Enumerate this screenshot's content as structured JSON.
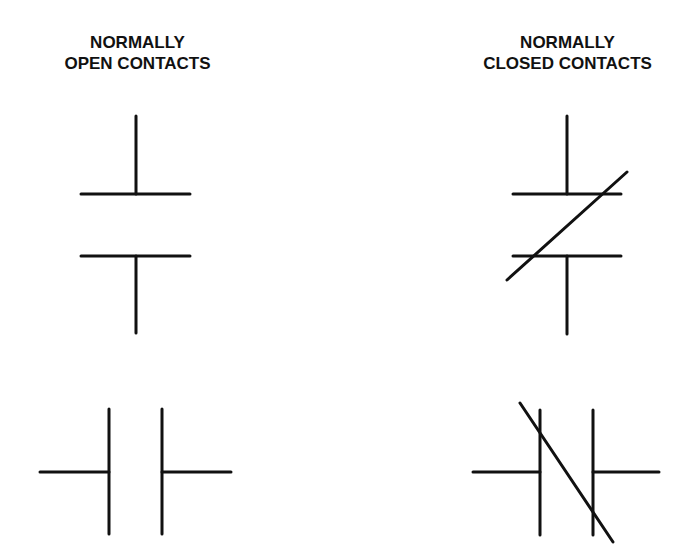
{
  "headings": {
    "normally_open": {
      "line1": "NORMALLY",
      "line2": "OPEN CONTACTS"
    },
    "normally_closed": {
      "line1": "NORMALLY",
      "line2": "CLOSED CONTACTS"
    }
  },
  "colors": {
    "stroke": "#111111",
    "background": "#ffffff"
  },
  "symbols": [
    {
      "name": "normally-open-contact-vertical",
      "style": "vertical"
    },
    {
      "name": "normally-closed-contact-vertical",
      "style": "vertical-with-slash"
    },
    {
      "name": "normally-open-contact-horizontal",
      "style": "horizontal"
    },
    {
      "name": "normally-closed-contact-horizontal",
      "style": "horizontal-with-slash"
    }
  ]
}
